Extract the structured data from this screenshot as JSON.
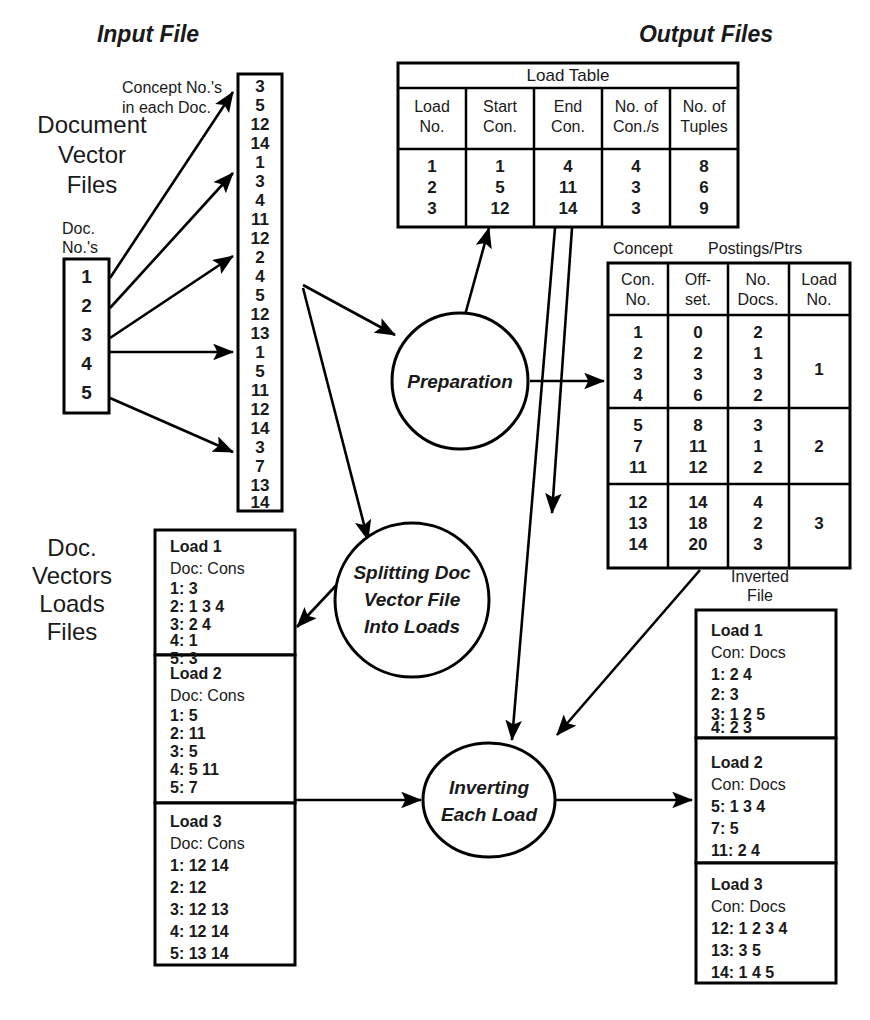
{
  "headers": {
    "input_file": "Input File",
    "output_files": "Output Files"
  },
  "labels": {
    "document_vector_files": [
      "Document",
      "Vector",
      "Files"
    ],
    "doc_nos": [
      "Doc.",
      "No.'s"
    ],
    "concept_nos": [
      "Concept No.'s",
      "in each Doc."
    ],
    "doc_vectors_loads_files": [
      "Doc.",
      "Vectors",
      "Loads",
      "Files"
    ],
    "concept": "Concept",
    "postings_ptrs": "Postings/Ptrs",
    "inverted_file": [
      "Inverted",
      "File"
    ]
  },
  "doc_column": {
    "name": "Doc. No.'s",
    "values": [
      "1",
      "2",
      "3",
      "4",
      "5"
    ]
  },
  "concept_column": {
    "name": "Concept No.'s in each Doc.",
    "values": [
      "3",
      "5",
      "12",
      "14",
      "1",
      "3",
      "4",
      "11",
      "12",
      "2",
      "4",
      "5",
      "12",
      "13",
      "1",
      "5",
      "11",
      "12",
      "14",
      "3",
      "7",
      "13",
      "14"
    ]
  },
  "load_table": {
    "title": "Load Table",
    "columns": [
      [
        "Load",
        "No."
      ],
      [
        "Start",
        "Con."
      ],
      [
        "End",
        "Con."
      ],
      [
        "No. of",
        "Con./s"
      ],
      [
        "No. of",
        "Tuples"
      ]
    ],
    "rows": [
      [
        "1",
        "1",
        "4",
        "4",
        "8"
      ],
      [
        "2",
        "5",
        "11",
        "3",
        "6"
      ],
      [
        "3",
        "12",
        "14",
        "3",
        "9"
      ]
    ]
  },
  "postings_table": {
    "columns": [
      [
        "Con.",
        "No."
      ],
      [
        "Off-",
        "set."
      ],
      [
        "No.",
        "Docs."
      ],
      [
        "Load",
        "No."
      ]
    ],
    "groups": [
      {
        "load_no": "1",
        "rows": [
          [
            "1",
            "0",
            "2"
          ],
          [
            "2",
            "2",
            "1"
          ],
          [
            "3",
            "3",
            "3"
          ],
          [
            "4",
            "6",
            "2"
          ]
        ]
      },
      {
        "load_no": "2",
        "rows": [
          [
            "5",
            "8",
            "3"
          ],
          [
            "7",
            "11",
            "1"
          ],
          [
            "11",
            "12",
            "2"
          ]
        ]
      },
      {
        "load_no": "3",
        "rows": [
          [
            "12",
            "14",
            "4"
          ],
          [
            "13",
            "18",
            "2"
          ],
          [
            "14",
            "20",
            "3"
          ]
        ]
      }
    ]
  },
  "processes": [
    {
      "id": "preparation",
      "lines": [
        "Preparation"
      ]
    },
    {
      "id": "splitting",
      "lines": [
        "Splitting Doc",
        "Vector File",
        "Into Loads"
      ]
    },
    {
      "id": "inverting",
      "lines": [
        "Inverting",
        "Each Load"
      ]
    }
  ],
  "doc_vector_loads": [
    {
      "title": "Load 1",
      "header": "Doc:  Cons",
      "rows": [
        "1:  3",
        "2:  1  3  4",
        "3:  2  4",
        "4:  1",
        "5:  3"
      ]
    },
    {
      "title": "Load 2",
      "header": "Doc:  Cons",
      "rows": [
        "1:  5",
        "2:  11",
        "3:  5",
        "4:  5  11",
        "5:  7"
      ]
    },
    {
      "title": "Load 3",
      "header": "Doc:  Cons",
      "rows": [
        "1:  12  14",
        "2:  12",
        "3:  12  13",
        "4:  12  14",
        "5:  13  14"
      ]
    }
  ],
  "inverted_loads": [
    {
      "title": "Load 1",
      "header": "Con: Docs",
      "rows": [
        "1:  2  4",
        "2:  3",
        "3:  1  2  5",
        "4:  2  3"
      ]
    },
    {
      "title": "Load 2",
      "header": "Con:  Docs",
      "rows": [
        "5:  1  3  4",
        "7:  5",
        "11:  2  4"
      ]
    },
    {
      "title": "Load 3",
      "header": "Con:  Docs",
      "rows": [
        "12:  1  2  3  4",
        "13:  3  5",
        "14:  1  4  5"
      ]
    }
  ],
  "colors": {
    "stroke": "#000000",
    "text": "#1a1a1a",
    "background": "#ffffff"
  }
}
